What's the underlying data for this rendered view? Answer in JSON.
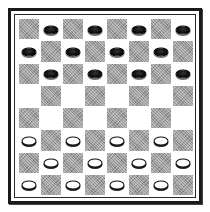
{
  "game": {
    "name": "Checkers",
    "board_size": 8,
    "colors": {
      "dark_square": "#9a9a9a",
      "light_square": "#ffffff",
      "black_piece": "#0d0d0d",
      "white_piece": "#ffffff",
      "frame": "#1a1a1a"
    },
    "board": [
      [
        "dark",
        "B",
        "dark",
        "B",
        "dark",
        "B",
        "dark",
        "B"
      ],
      [
        "B",
        "dark",
        "B",
        "dark",
        "B",
        "dark",
        "B",
        "dark"
      ],
      [
        "dark",
        "B",
        "dark",
        "B",
        "dark",
        "B",
        "dark",
        "B"
      ],
      [
        "",
        "dark",
        "",
        "dark",
        "",
        "dark",
        "",
        "dark"
      ],
      [
        "dark",
        "",
        "dark",
        "",
        "dark",
        "",
        "dark",
        ""
      ],
      [
        "W",
        "dark",
        "W",
        "dark",
        "W",
        "dark",
        "W",
        "dark"
      ],
      [
        "dark",
        "W",
        "dark",
        "W",
        "dark",
        "W",
        "dark",
        "W"
      ],
      [
        "W",
        "dark",
        "W",
        "dark",
        "W",
        "dark",
        "W",
        "dark"
      ]
    ],
    "piece_counts": {
      "black": 12,
      "white": 12
    }
  }
}
